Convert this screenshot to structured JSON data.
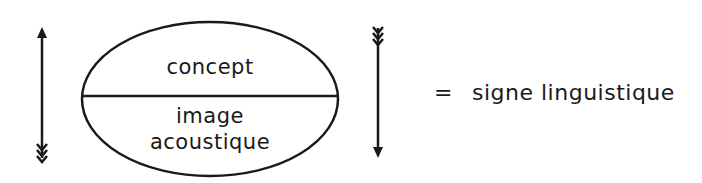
{
  "diagram": {
    "signified_label": "concept",
    "signifier_label_line1": "image",
    "signifier_label_line2": "acoustique",
    "equals_sign": "=",
    "result_label": "signe linguistique",
    "left_arrow": {
      "direction": "up"
    },
    "right_arrow": {
      "direction": "down"
    },
    "stroke_color": "#1a1a1a",
    "background_color": "#ffffff"
  }
}
